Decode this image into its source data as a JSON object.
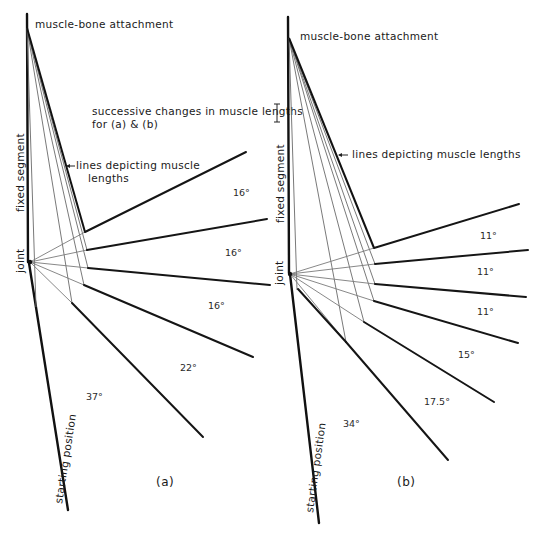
{
  "labels": {
    "attachment_a": "muscle-bone attachment",
    "attachment_b": "muscle-bone attachment",
    "scale_line1": "successive changes in muscle lengths",
    "scale_line2": "for (a) & (b)",
    "muscle_lines_a_1": "lines depicting muscle",
    "muscle_lines_a_2": "lengths",
    "muscle_lines_b": "lines depicting muscle lengths",
    "fixed_segment_a": "fixed segment",
    "fixed_segment_b": "fixed segment",
    "joint_a": "joint",
    "joint_b": "joint",
    "start_a": "starting position",
    "start_b": "starting position",
    "panel_a": "(a)",
    "panel_b": "(b)"
  },
  "panel_a": {
    "angles": [
      "37°",
      "22°",
      "16°",
      "16°",
      "16°"
    ]
  },
  "panel_b": {
    "angles": [
      "34°",
      "17.5°",
      "15°",
      "11°",
      "11°",
      "11°"
    ]
  },
  "colors": {
    "ink": "#111111",
    "thin_line": "#7a7a7a",
    "background": "#ffffff"
  }
}
